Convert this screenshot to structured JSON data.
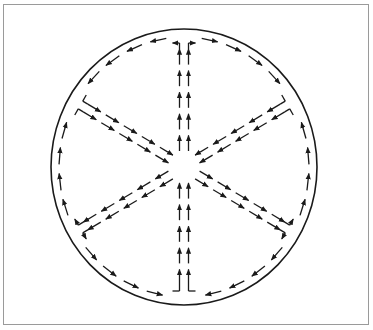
{
  "diagram": {
    "colors": {
      "ink": "#1a1a1a",
      "frame": "#9a9a9a",
      "background": "#ffffff"
    },
    "boundary": {
      "shape": "circle",
      "cx": 184,
      "cy": 167,
      "rx": 133,
      "ry": 138
    },
    "spokes": [
      {
        "id": "top",
        "angle_deg": -90,
        "direction": "outward",
        "label": "Top spoke (arrows pointing up, away from center)"
      },
      {
        "id": "upper-right",
        "angle_deg": -30,
        "direction": "inward",
        "label": "Upper-right spoke (arrows pointing toward center)"
      },
      {
        "id": "lower-right",
        "angle_deg": 30,
        "direction": "outward",
        "label": "Lower-right spoke (arrows pointing away from center)"
      },
      {
        "id": "bottom",
        "angle_deg": 90,
        "direction": "inward",
        "label": "Bottom spoke (arrows pointing up, toward center)"
      },
      {
        "id": "lower-left",
        "angle_deg": 150,
        "direction": "outward",
        "label": "Lower-left spoke (arrows pointing away from center)"
      },
      {
        "id": "upper-left",
        "angle_deg": 210,
        "direction": "inward",
        "label": "Upper-left spoke (arrows pointing toward center)"
      }
    ],
    "rim_flow": [
      {
        "from": "top",
        "to": "upper-left",
        "sense": "counterclockwise"
      },
      {
        "from": "top",
        "to": "upper-right",
        "sense": "clockwise"
      },
      {
        "from": "lower-right",
        "to": "upper-right",
        "sense": "counterclockwise"
      },
      {
        "from": "lower-right",
        "to": "bottom",
        "sense": "clockwise"
      },
      {
        "from": "lower-left",
        "to": "upper-left",
        "sense": "clockwise"
      },
      {
        "from": "lower-left",
        "to": "bottom",
        "sense": "counterclockwise"
      }
    ]
  }
}
